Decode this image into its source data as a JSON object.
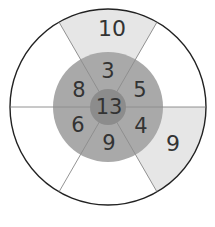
{
  "diagram": {
    "type": "number-wheel",
    "center_value": "13",
    "middle_ring_values": [
      "3",
      "5",
      "4",
      "9",
      "6",
      "8"
    ],
    "outer_ring_values": [
      "10",
      "",
      "9",
      "",
      "",
      ""
    ],
    "colors": {
      "outer_shaded": "#e6e6e6",
      "outer_plain": "#ffffff",
      "middle_ring": "#a9a9a9",
      "center": "#8c8c8c",
      "lines": "#777777",
      "outline": "#222222"
    }
  }
}
